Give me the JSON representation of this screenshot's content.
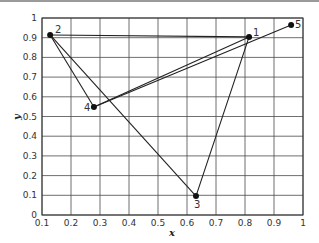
{
  "chart_data": {
    "type": "scatter",
    "title": "",
    "xlabel": "x",
    "ylabel": "y",
    "xlim": [
      0.1,
      1
    ],
    "ylim": [
      0,
      1
    ],
    "grid": true,
    "xticks": [
      "0.1",
      "0.2",
      "0.3",
      "0.4",
      "0.5",
      "0.6",
      "0.7",
      "0.8",
      "0.9",
      "1"
    ],
    "yticks": [
      "0",
      "0.1",
      "0.2",
      "0.3",
      "0.4",
      "0.5",
      "0.6",
      "0.7",
      "0.8",
      "0.9",
      "1"
    ],
    "points": [
      {
        "label": "1",
        "x": 0.814,
        "y": 0.904
      },
      {
        "label": "2",
        "x": 0.128,
        "y": 0.914
      },
      {
        "label": "3",
        "x": 0.631,
        "y": 0.096
      },
      {
        "label": "4",
        "x": 0.279,
        "y": 0.548
      },
      {
        "label": "5",
        "x": 0.959,
        "y": 0.964
      }
    ],
    "edges": [
      [
        "2",
        "1"
      ],
      [
        "1",
        "3"
      ],
      [
        "3",
        "2"
      ],
      [
        "2",
        "4"
      ],
      [
        "4",
        "1"
      ],
      [
        "4",
        "5"
      ]
    ],
    "colors": {
      "line": "#222222",
      "grid": "#4a4a4a",
      "marker": "#111111"
    }
  }
}
